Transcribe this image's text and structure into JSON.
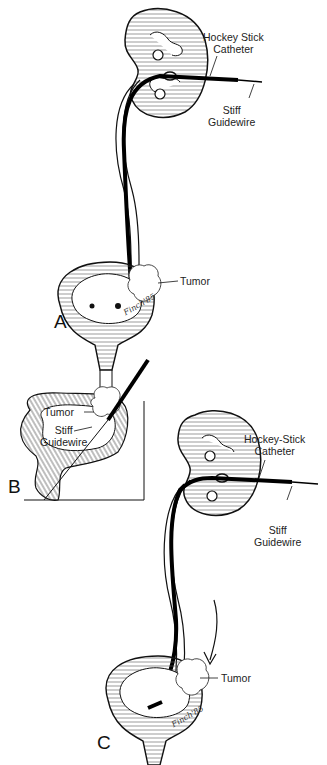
{
  "figure": {
    "panels": [
      {
        "id": "A",
        "label": "A",
        "annotations": {
          "catheter_line1": "Hockey Stick",
          "catheter_line2": "Catheter",
          "guidewire_line1": "Stiff",
          "guidewire_line2": "Guidewire",
          "tumor": "Tumor"
        },
        "signature": "Finch'85"
      },
      {
        "id": "B",
        "label": "B",
        "annotations": {
          "tumor": "Tumor",
          "guidewire_line1": "Stiff",
          "guidewire_line2": "Guidewire"
        }
      },
      {
        "id": "C",
        "label": "C",
        "annotations": {
          "catheter_line1": "Hockey-Stick",
          "catheter_line2": "Catheter",
          "guidewire_line1": "Stiff",
          "guidewire_line2": "Guidewire",
          "tumor": "Tumor"
        },
        "signature": "Finch'85"
      }
    ]
  },
  "colors": {
    "ink": "#111111",
    "background": "#ffffff"
  }
}
